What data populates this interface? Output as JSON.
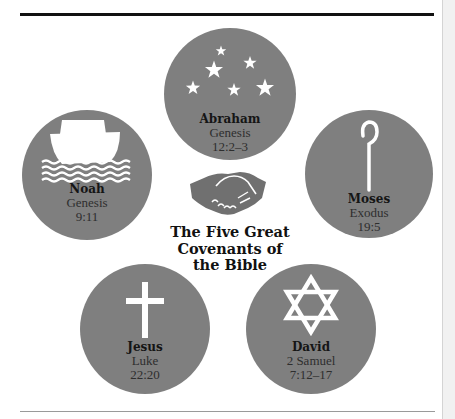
{
  "title": {
    "lines": [
      "The Five Great",
      "Covenants of",
      "the Bible"
    ]
  },
  "center_icon": "handshake-icon",
  "covenants": [
    {
      "name": "Abraham",
      "book": "Genesis",
      "verse": "12:2–3",
      "icon": "stars-icon"
    },
    {
      "name": "Noah",
      "book": "Genesis",
      "verse": "9:11",
      "icon": "ark-icon"
    },
    {
      "name": "Moses",
      "book": "Exodus",
      "verse": "19:5",
      "icon": "shepherd-staff-icon"
    },
    {
      "name": "Jesus",
      "book": "Luke",
      "verse": "22:20",
      "icon": "cross-icon"
    },
    {
      "name": "David",
      "book": "2 Samuel",
      "verse": "7:12–17",
      "icon": "star-of-david-icon"
    }
  ],
  "colors": {
    "circle_fill": "#7f7f7f",
    "icon_fill": "#ffffff",
    "title_text": "#111111",
    "top_rule": "#111111",
    "bottom_rule": "#9a9a9a"
  }
}
